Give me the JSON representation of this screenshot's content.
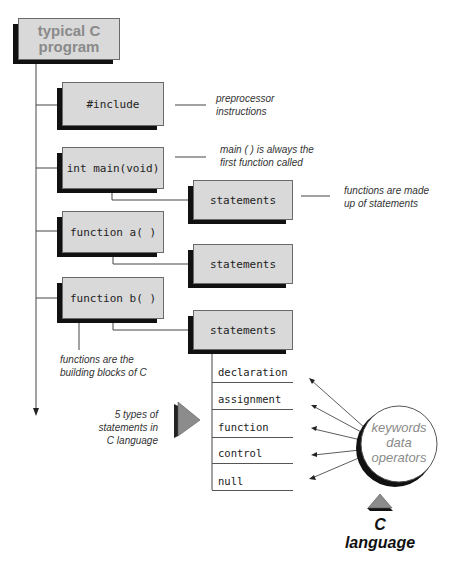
{
  "diagram": {
    "title": "typical C program",
    "title_lines": [
      "typical C",
      "program"
    ],
    "nodes": {
      "include": "#include",
      "main": "int main(void)",
      "function_a": "function a( )",
      "function_b": "function b( )",
      "statements_1": "statements",
      "statements_2": "statements",
      "statements_3": "statements"
    },
    "annotations": {
      "preprocessor": [
        "preprocessor",
        "instructions"
      ],
      "main_first": [
        "main ( ) is always the",
        "first function called"
      ],
      "functions_statements": [
        "functions are made",
        "up of statements"
      ],
      "building_blocks": [
        "functions are the",
        "building blocks of C"
      ],
      "five_types": [
        "5 types of",
        "statements in",
        "C language"
      ]
    },
    "statement_types": [
      "declaration",
      "assignment",
      "function",
      "control",
      "null"
    ],
    "circle": {
      "lines": [
        "keywords",
        "data",
        "operators"
      ]
    },
    "footer": {
      "lines": [
        "C",
        "language"
      ]
    },
    "colors": {
      "box_fill": "#d9d9d9",
      "shadow": "#111111",
      "title_text": "#8a8a8a",
      "triangle": "#8c8c8c"
    }
  }
}
